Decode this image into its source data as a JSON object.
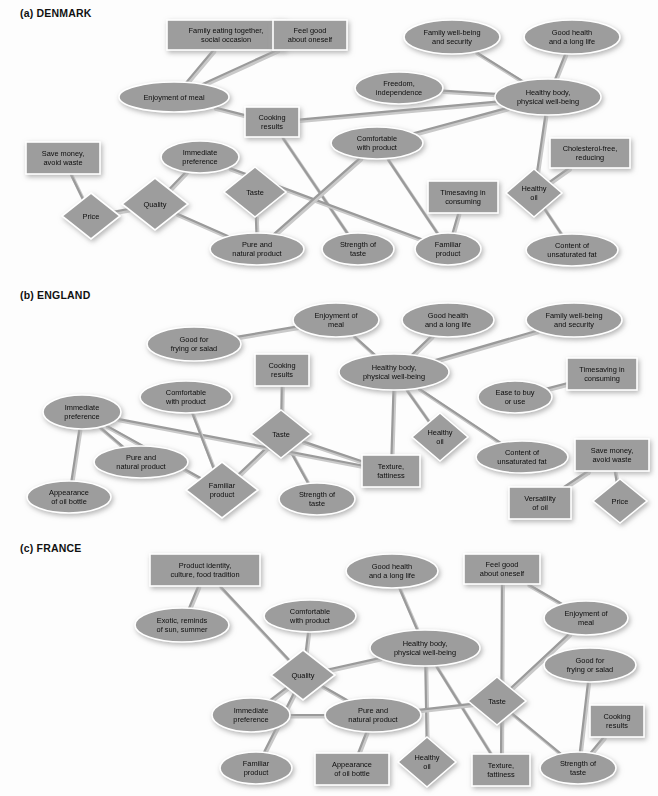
{
  "figure": {
    "background": "#fdfdfd",
    "node_fill": "#9d9d9d",
    "node_border": "#ffffff",
    "edge_color": "#9a9a9a",
    "text_color": "#0d0d0d"
  },
  "panels": [
    {
      "id": "denmark",
      "title": "(a) DENMARK",
      "nodes": [
        {
          "id": "fam_eat",
          "label": [
            "Family eating together,",
            "social occasion"
          ],
          "shape": "rect",
          "x": 226,
          "y": 35,
          "w": 118,
          "h": 30
        },
        {
          "id": "feelgood",
          "label": [
            "Feel good",
            "about oneself"
          ],
          "shape": "rect",
          "x": 310,
          "y": 35,
          "w": 74,
          "h": 30
        },
        {
          "id": "famwell",
          "label": [
            "Family well-being",
            "and security"
          ],
          "shape": "ellipse",
          "x": 452,
          "y": 37,
          "w": 96,
          "h": 34
        },
        {
          "id": "goodhealth",
          "label": [
            "Good health",
            "and a long life"
          ],
          "shape": "ellipse",
          "x": 572,
          "y": 37,
          "w": 96,
          "h": 34
        },
        {
          "id": "freedom",
          "label": [
            "Freedom,",
            "independence"
          ],
          "shape": "ellipse",
          "x": 399,
          "y": 88,
          "w": 88,
          "h": 32
        },
        {
          "id": "healthybody",
          "label": [
            "Healthy body,",
            "physical well-being"
          ],
          "shape": "ellipse",
          "x": 548,
          "y": 97,
          "w": 106,
          "h": 36
        },
        {
          "id": "enjoy",
          "label": [
            "Enjoyment of meal"
          ],
          "shape": "ellipse",
          "x": 174,
          "y": 97,
          "w": 110,
          "h": 30
        },
        {
          "id": "cooking",
          "label": [
            "Cooking",
            "results"
          ],
          "shape": "rect",
          "x": 272,
          "y": 122,
          "w": 54,
          "h": 30
        },
        {
          "id": "comfort",
          "label": [
            "Comfortable",
            "with product"
          ],
          "shape": "ellipse",
          "x": 377,
          "y": 143,
          "w": 92,
          "h": 32
        },
        {
          "id": "cholesterol",
          "label": [
            "Cholesterol-free,",
            "reducing"
          ],
          "shape": "rect",
          "x": 590,
          "y": 153,
          "w": 80,
          "h": 30
        },
        {
          "id": "savemoney",
          "label": [
            "Save money,",
            "avoid waste"
          ],
          "shape": "rect",
          "x": 63,
          "y": 158,
          "w": 74,
          "h": 32
        },
        {
          "id": "immediate",
          "label": [
            "Immediate",
            "preference"
          ],
          "shape": "ellipse",
          "x": 200,
          "y": 157,
          "w": 78,
          "h": 32
        },
        {
          "id": "taste",
          "label": [
            "Taste"
          ],
          "shape": "diamond",
          "x": 255,
          "y": 192,
          "w": 62,
          "h": 50
        },
        {
          "id": "timesaving",
          "label": [
            "Timesaving in",
            "consuming"
          ],
          "shape": "rect",
          "x": 463,
          "y": 197,
          "w": 70,
          "h": 32
        },
        {
          "id": "healthyoil",
          "label": [
            "Healthy",
            "oil"
          ],
          "shape": "diamond",
          "x": 534,
          "y": 193,
          "w": 56,
          "h": 48
        },
        {
          "id": "quality",
          "label": [
            "Quality"
          ],
          "shape": "diamond",
          "x": 155,
          "y": 204,
          "w": 66,
          "h": 52
        },
        {
          "id": "price",
          "label": [
            "Price"
          ],
          "shape": "diamond",
          "x": 91,
          "y": 216,
          "w": 58,
          "h": 46
        },
        {
          "id": "pure",
          "label": [
            "Pure and",
            "natural product"
          ],
          "shape": "ellipse",
          "x": 257,
          "y": 249,
          "w": 94,
          "h": 32
        },
        {
          "id": "strength",
          "label": [
            "Strength of",
            "taste"
          ],
          "shape": "ellipse",
          "x": 358,
          "y": 249,
          "w": 72,
          "h": 32
        },
        {
          "id": "familiar",
          "label": [
            "Familiar",
            "product"
          ],
          "shape": "ellipse",
          "x": 448,
          "y": 249,
          "w": 66,
          "h": 32
        },
        {
          "id": "unsat",
          "label": [
            "Content of",
            "unsaturated fat"
          ],
          "shape": "ellipse",
          "x": 572,
          "y": 250,
          "w": 92,
          "h": 32
        }
      ],
      "edges": [
        [
          "fam_eat",
          "enjoy"
        ],
        [
          "feelgood",
          "enjoy"
        ],
        [
          "enjoy",
          "cooking"
        ],
        [
          "famwell",
          "healthybody"
        ],
        [
          "goodhealth",
          "healthybody"
        ],
        [
          "freedom",
          "healthybody"
        ],
        [
          "cooking",
          "healthybody"
        ],
        [
          "comfort",
          "healthybody"
        ],
        [
          "healthybody",
          "healthyoil"
        ],
        [
          "healthyoil",
          "cholesterol"
        ],
        [
          "healthyoil",
          "unsat"
        ],
        [
          "savemoney",
          "price"
        ],
        [
          "price",
          "quality"
        ],
        [
          "quality",
          "immediate"
        ],
        [
          "quality",
          "pure"
        ],
        [
          "taste",
          "pure"
        ],
        [
          "cooking",
          "strength"
        ],
        [
          "immediate",
          "familiar"
        ],
        [
          "comfort",
          "pure"
        ],
        [
          "comfort",
          "familiar"
        ],
        [
          "timesaving",
          "familiar"
        ]
      ]
    },
    {
      "id": "england",
      "title": "(b) ENGLAND",
      "nodes": [
        {
          "id": "enjoy",
          "label": [
            "Enjoyment of",
            "meal"
          ],
          "shape": "ellipse",
          "x": 336,
          "y": 38,
          "w": 86,
          "h": 34
        },
        {
          "id": "goodhealth",
          "label": [
            "Good health",
            "and a long life"
          ],
          "shape": "ellipse",
          "x": 448,
          "y": 38,
          "w": 92,
          "h": 34
        },
        {
          "id": "famwell",
          "label": [
            "Family well-being",
            "and security"
          ],
          "shape": "ellipse",
          "x": 574,
          "y": 38,
          "w": 96,
          "h": 34
        },
        {
          "id": "goodfry",
          "label": [
            "Good for",
            "frying or salad"
          ],
          "shape": "ellipse",
          "x": 194,
          "y": 62,
          "w": 94,
          "h": 34
        },
        {
          "id": "cooking",
          "label": [
            "Cooking",
            "results"
          ],
          "shape": "rect",
          "x": 282,
          "y": 88,
          "w": 54,
          "h": 32
        },
        {
          "id": "healthybody",
          "label": [
            "Healthy body,",
            "physical well-being"
          ],
          "shape": "ellipse",
          "x": 394,
          "y": 90,
          "w": 110,
          "h": 36
        },
        {
          "id": "timesaving",
          "label": [
            "Timesaving in",
            "consuming"
          ],
          "shape": "rect",
          "x": 602,
          "y": 92,
          "w": 70,
          "h": 32
        },
        {
          "id": "comfort",
          "label": [
            "Comfortable",
            "with product"
          ],
          "shape": "ellipse",
          "x": 186,
          "y": 115,
          "w": 92,
          "h": 32
        },
        {
          "id": "ease",
          "label": [
            "Ease to buy",
            "or use"
          ],
          "shape": "ellipse",
          "x": 515,
          "y": 115,
          "w": 74,
          "h": 32
        },
        {
          "id": "immediate",
          "label": [
            "Immediate",
            "preference"
          ],
          "shape": "ellipse",
          "x": 82,
          "y": 130,
          "w": 78,
          "h": 34
        },
        {
          "id": "taste",
          "label": [
            "Taste"
          ],
          "shape": "diamond",
          "x": 281,
          "y": 152,
          "w": 60,
          "h": 48
        },
        {
          "id": "healthyoil",
          "label": [
            "Healthy",
            "oil"
          ],
          "shape": "diamond",
          "x": 440,
          "y": 155,
          "w": 56,
          "h": 48
        },
        {
          "id": "unsat",
          "label": [
            "Content of",
            "unsaturated fat"
          ],
          "shape": "ellipse",
          "x": 522,
          "y": 175,
          "w": 92,
          "h": 32
        },
        {
          "id": "savemoney",
          "label": [
            "Save money,",
            "avoid waste"
          ],
          "shape": "rect",
          "x": 612,
          "y": 173,
          "w": 74,
          "h": 32
        },
        {
          "id": "pure",
          "label": [
            "Pure and",
            "natural product"
          ],
          "shape": "ellipse",
          "x": 141,
          "y": 180,
          "w": 94,
          "h": 32
        },
        {
          "id": "texture",
          "label": [
            "Texture,",
            "fattiness"
          ],
          "shape": "rect",
          "x": 391,
          "y": 189,
          "w": 58,
          "h": 32
        },
        {
          "id": "appearance",
          "label": [
            "Appearance",
            "of oil bottle"
          ],
          "shape": "ellipse",
          "x": 69,
          "y": 215,
          "w": 84,
          "h": 32
        },
        {
          "id": "familiar",
          "label": [
            "Familiar",
            "product"
          ],
          "shape": "diamond",
          "x": 222,
          "y": 208,
          "w": 72,
          "h": 56
        },
        {
          "id": "strength",
          "label": [
            "Strength of",
            "taste"
          ],
          "shape": "ellipse",
          "x": 317,
          "y": 217,
          "w": 76,
          "h": 32
        },
        {
          "id": "versatility",
          "label": [
            "Versatility",
            "of oil"
          ],
          "shape": "rect",
          "x": 540,
          "y": 221,
          "w": 62,
          "h": 32
        },
        {
          "id": "price",
          "label": [
            "Price"
          ],
          "shape": "diamond",
          "x": 620,
          "y": 219,
          "w": 54,
          "h": 44
        }
      ],
      "edges": [
        [
          "goodfry",
          "enjoy"
        ],
        [
          "enjoy",
          "healthybody"
        ],
        [
          "goodhealth",
          "healthybody"
        ],
        [
          "famwell",
          "healthybody"
        ],
        [
          "ease",
          "timesaving"
        ],
        [
          "healthybody",
          "healthyoil"
        ],
        [
          "healthybody",
          "unsat"
        ],
        [
          "healthybody",
          "texture"
        ],
        [
          "cooking",
          "taste"
        ],
        [
          "taste",
          "texture"
        ],
        [
          "taste",
          "strength"
        ],
        [
          "taste",
          "familiar"
        ],
        [
          "immediate",
          "appearance"
        ],
        [
          "immediate",
          "pure"
        ],
        [
          "immediate",
          "texture"
        ],
        [
          "immediate",
          "familiar"
        ],
        [
          "comfort",
          "familiar"
        ],
        [
          "savemoney",
          "versatility"
        ],
        [
          "savemoney",
          "price"
        ]
      ]
    },
    {
      "id": "france",
      "title": "(c) FRANCE",
      "nodes": [
        {
          "id": "prodident",
          "label": [
            "Product identity,",
            "culture, food tradition"
          ],
          "shape": "rect",
          "x": 205,
          "y": 35,
          "w": 110,
          "h": 32
        },
        {
          "id": "goodhealth",
          "label": [
            "Good health",
            "and a long life"
          ],
          "shape": "ellipse",
          "x": 392,
          "y": 36,
          "w": 92,
          "h": 34
        },
        {
          "id": "feelgood",
          "label": [
            "Feel good",
            "about oneself"
          ],
          "shape": "rect",
          "x": 502,
          "y": 34,
          "w": 76,
          "h": 30
        },
        {
          "id": "comfort",
          "label": [
            "Comfortable",
            "with product"
          ],
          "shape": "ellipse",
          "x": 310,
          "y": 81,
          "w": 92,
          "h": 32
        },
        {
          "id": "enjoy",
          "label": [
            "Enjoyment of",
            "meal"
          ],
          "shape": "ellipse",
          "x": 586,
          "y": 83,
          "w": 84,
          "h": 34
        },
        {
          "id": "exotic",
          "label": [
            "Exotic, reminds",
            "of sun, summer"
          ],
          "shape": "ellipse",
          "x": 182,
          "y": 90,
          "w": 94,
          "h": 34
        },
        {
          "id": "healthybody",
          "label": [
            "Healthy body,",
            "physical well-being"
          ],
          "shape": "ellipse",
          "x": 425,
          "y": 113,
          "w": 110,
          "h": 36
        },
        {
          "id": "goodfry",
          "label": [
            "Good for",
            "frying or salad"
          ],
          "shape": "ellipse",
          "x": 590,
          "y": 130,
          "w": 92,
          "h": 34
        },
        {
          "id": "quality",
          "label": [
            "Quality"
          ],
          "shape": "diamond",
          "x": 303,
          "y": 140,
          "w": 64,
          "h": 50
        },
        {
          "id": "taste",
          "label": [
            "Taste"
          ],
          "shape": "diamond",
          "x": 497,
          "y": 166,
          "w": 58,
          "h": 48
        },
        {
          "id": "immediate",
          "label": [
            "Immediate",
            "preference"
          ],
          "shape": "ellipse",
          "x": 251,
          "y": 180,
          "w": 78,
          "h": 34
        },
        {
          "id": "pure",
          "label": [
            "Pure and",
            "natural product"
          ],
          "shape": "ellipse",
          "x": 373,
          "y": 180,
          "w": 96,
          "h": 34
        },
        {
          "id": "cooking",
          "label": [
            "Cooking",
            "results"
          ],
          "shape": "rect",
          "x": 617,
          "y": 186,
          "w": 54,
          "h": 32
        },
        {
          "id": "healthyoil",
          "label": [
            "Healthy",
            "oil"
          ],
          "shape": "diamond",
          "x": 427,
          "y": 227,
          "w": 58,
          "h": 50
        },
        {
          "id": "familiar",
          "label": [
            "Familiar",
            "product"
          ],
          "shape": "ellipse",
          "x": 256,
          "y": 233,
          "w": 72,
          "h": 32
        },
        {
          "id": "appearance",
          "label": [
            "Appearance",
            "of oil bottle"
          ],
          "shape": "rect",
          "x": 352,
          "y": 234,
          "w": 74,
          "h": 32
        },
        {
          "id": "texture",
          "label": [
            "Texture,",
            "fattiness"
          ],
          "shape": "rect",
          "x": 501,
          "y": 235,
          "w": 58,
          "h": 32
        },
        {
          "id": "strength",
          "label": [
            "Strength of",
            "taste"
          ],
          "shape": "ellipse",
          "x": 578,
          "y": 233,
          "w": 76,
          "h": 32
        }
      ],
      "edges": [
        [
          "prodident",
          "exotic"
        ],
        [
          "prodident",
          "quality"
        ],
        [
          "comfort",
          "quality"
        ],
        [
          "quality",
          "healthybody"
        ],
        [
          "quality",
          "immediate"
        ],
        [
          "quality",
          "pure"
        ],
        [
          "quality",
          "familiar"
        ],
        [
          "goodhealth",
          "healthybody"
        ],
        [
          "healthybody",
          "healthyoil"
        ],
        [
          "healthybody",
          "texture"
        ],
        [
          "feelgood",
          "enjoy"
        ],
        [
          "feelgood",
          "texture"
        ],
        [
          "enjoy",
          "taste"
        ],
        [
          "goodfry",
          "strength"
        ],
        [
          "cooking",
          "strength"
        ],
        [
          "taste",
          "strength"
        ],
        [
          "taste",
          "pure"
        ],
        [
          "immediate",
          "pure"
        ],
        [
          "pure",
          "appearance"
        ]
      ]
    }
  ]
}
